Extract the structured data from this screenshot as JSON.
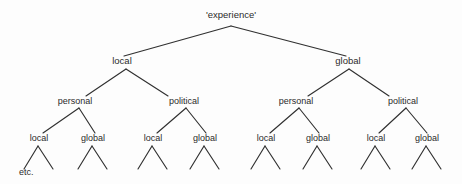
{
  "diagram": {
    "type": "tree",
    "title_text": "'experience'",
    "background_color": "#fdfdfd",
    "line_color": "#303030",
    "text_color": "#2b2b2b",
    "continuation_note": "etc.",
    "levels": [
      {
        "depth": 0,
        "labels": [
          "'experience'"
        ]
      },
      {
        "depth": 1,
        "labels": [
          "local",
          "global"
        ]
      },
      {
        "depth": 2,
        "labels": [
          "personal",
          "political",
          "personal",
          "political"
        ]
      },
      {
        "depth": 3,
        "labels": [
          "local",
          "global",
          "local",
          "global",
          "local",
          "global",
          "local",
          "global"
        ]
      }
    ],
    "root": {
      "label": "'experience'",
      "x": 231,
      "y": 18
    },
    "level1": [
      {
        "label": "local",
        "x": 122,
        "y": 64
      },
      {
        "label": "global",
        "x": 348,
        "y": 64
      }
    ],
    "level2": [
      {
        "label": "personal",
        "x": 75,
        "y": 104
      },
      {
        "label": "political",
        "x": 184,
        "y": 104
      },
      {
        "label": "personal",
        "x": 296,
        "y": 104
      },
      {
        "label": "political",
        "x": 403,
        "y": 104
      }
    ],
    "level3": [
      {
        "label": "local",
        "x": 39,
        "y": 141
      },
      {
        "label": "global",
        "x": 93,
        "y": 141
      },
      {
        "label": "local",
        "x": 153,
        "y": 141
      },
      {
        "label": "global",
        "x": 205,
        "y": 141
      },
      {
        "label": "local",
        "x": 266,
        "y": 141
      },
      {
        "label": "global",
        "x": 318,
        "y": 141
      },
      {
        "label": "local",
        "x": 376,
        "y": 141
      },
      {
        "label": "global",
        "x": 427,
        "y": 141
      }
    ],
    "etc": {
      "label": "etc.",
      "x": 19,
      "y": 175
    }
  }
}
